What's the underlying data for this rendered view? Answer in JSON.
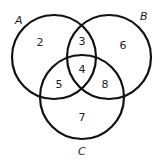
{
  "diagram": {
    "type": "venn-3",
    "sets": [
      {
        "id": "A",
        "label": "A"
      },
      {
        "id": "B",
        "label": "B"
      },
      {
        "id": "C",
        "label": "C"
      }
    ],
    "regions": {
      "A_only": "2",
      "A_and_B_only": "3",
      "B_only": "6",
      "A_and_B_and_C": "4",
      "A_and_C_only": "5",
      "B_and_C_only": "8",
      "C_only": "7"
    },
    "stroke_color": "#111111"
  }
}
